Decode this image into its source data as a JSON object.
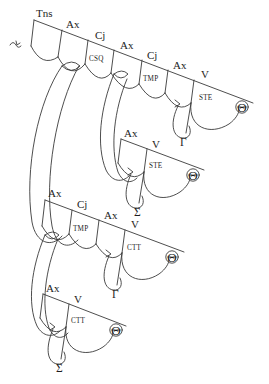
{
  "diagram": {
    "type": "hand-drawn-dependency-tree",
    "title": "",
    "colors": {
      "background": "#ffffff",
      "stroke": "#3a3a3a",
      "text": "#1d1d1d"
    },
    "branches": [
      {
        "id": "branch-1",
        "node_labels": [
          "Tns",
          "Ax",
          "Cj",
          "Ax",
          "Cj",
          "Ax",
          "V"
        ],
        "sub_labels": [
          "CSQ",
          "TMP",
          "STE"
        ],
        "terminals": [
          "Θ",
          "Γ"
        ]
      },
      {
        "id": "branch-2",
        "node_labels": [
          "Ax",
          "V"
        ],
        "sub_labels": [
          "STE"
        ],
        "terminals": [
          "Θ",
          "Σ"
        ]
      },
      {
        "id": "branch-3",
        "node_labels": [
          "Ax",
          "Cj",
          "Ax",
          "V"
        ],
        "sub_labels": [
          "TMP",
          "CTT"
        ],
        "terminals": [
          "Θ",
          "Γ"
        ]
      },
      {
        "id": "branch-4",
        "node_labels": [
          "Ax",
          "V"
        ],
        "sub_labels": [
          "CTT"
        ],
        "terminals": [
          "Θ",
          "Σ"
        ]
      }
    ],
    "labels": {
      "b1_tns": "Tns",
      "b1_ax1": "Ax",
      "b1_cj1": "Cj",
      "b1_csq": "CSQ",
      "b1_ax2": "Ax",
      "b1_cj2": "Cj",
      "b1_tmp": "TMP",
      "b1_ax3": "Ax",
      "b1_v": "V",
      "b1_ste": "STE",
      "b1_theta": "Θ",
      "b1_gamma": "Γ",
      "b2_ax": "Ax",
      "b2_v": "V",
      "b2_ste": "STE",
      "b2_theta": "Θ",
      "b2_sigma": "Σ",
      "b3_ax1": "Ax",
      "b3_cj": "Cj",
      "b3_tmp": "TMP",
      "b3_ax2": "Ax",
      "b3_v": "V",
      "b3_ctt": "CTT",
      "b3_theta": "Θ",
      "b3_gamma": "Γ",
      "b4_ax": "Ax",
      "b4_v": "V",
      "b4_ctt": "CTT",
      "b4_theta": "Θ",
      "b4_sigma": "Σ"
    }
  }
}
